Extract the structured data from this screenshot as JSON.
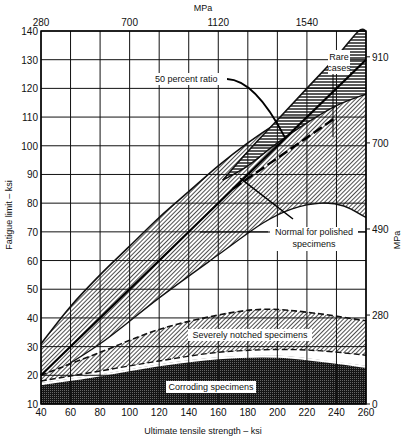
{
  "chart_data": {
    "type": "area",
    "title": "",
    "xlabel": "Ultimate tensile strength – ksi",
    "ylabel": "Fatigue limit – ksi",
    "top_axis_label": "MPa",
    "right_axis_label": "MPa",
    "xlim": [
      40,
      260
    ],
    "ylim": [
      10,
      140
    ],
    "x_ticks": [
      40,
      60,
      80,
      100,
      120,
      140,
      160,
      180,
      200,
      220,
      240,
      260
    ],
    "y_ticks": [
      10,
      20,
      30,
      40,
      50,
      60,
      70,
      80,
      90,
      100,
      110,
      120,
      130,
      140
    ],
    "top_ticks": [
      {
        "label": "280",
        "ksi": 40
      },
      {
        "label": "700",
        "ksi": 100
      },
      {
        "label": "1120",
        "ksi": 160
      },
      {
        "label": "1540",
        "ksi": 220
      }
    ],
    "right_ticks": [
      {
        "label": "0",
        "ksi": 10
      },
      {
        "label": "280",
        "ksi": 41
      },
      {
        "label": "490",
        "ksi": 71
      },
      {
        "label": "700",
        "ksi": 101
      },
      {
        "label": "910",
        "ksi": 131
      }
    ],
    "grid": true,
    "regions": [
      {
        "name": "Corroding specimens",
        "pattern": "dense-dots",
        "upper": [
          [
            40,
            17
          ],
          [
            80,
            20
          ],
          [
            120,
            23.5
          ],
          [
            160,
            26
          ],
          [
            200,
            26.5
          ],
          [
            230,
            25
          ],
          [
            260,
            23
          ]
        ],
        "lower": [
          [
            40,
            10
          ],
          [
            260,
            10
          ]
        ]
      },
      {
        "name": "Severely notched specimens",
        "pattern": "diagonal-hatch",
        "upper": [
          [
            40,
            20
          ],
          [
            80,
            28
          ],
          [
            120,
            36
          ],
          [
            160,
            41
          ],
          [
            190,
            43
          ],
          [
            220,
            42
          ],
          [
            260,
            39
          ]
        ],
        "lower": [
          [
            40,
            18
          ],
          [
            80,
            21.5
          ],
          [
            120,
            25
          ],
          [
            160,
            28
          ],
          [
            200,
            29
          ],
          [
            230,
            28.5
          ],
          [
            260,
            27
          ]
        ]
      },
      {
        "name": "Normal for polished specimens",
        "pattern": "diagonal-hatch",
        "upper": [
          [
            40,
            31
          ],
          [
            60,
            44
          ],
          [
            80,
            55
          ],
          [
            100,
            65
          ],
          [
            120,
            75
          ],
          [
            140,
            84
          ],
          [
            160,
            93
          ],
          [
            180,
            101
          ],
          [
            200,
            108
          ],
          [
            220,
            114
          ],
          [
            240,
            117
          ],
          [
            260,
            118
          ]
        ],
        "lower": [
          [
            40,
            18
          ],
          [
            80,
            31
          ],
          [
            120,
            47
          ],
          [
            160,
            62
          ],
          [
            190,
            73
          ],
          [
            210,
            78
          ],
          [
            230,
            80
          ],
          [
            245,
            79
          ],
          [
            260,
            75
          ]
        ]
      },
      {
        "name": "Rare cases",
        "pattern": "horizontal-hatch",
        "upper": [
          [
            163,
            88
          ],
          [
            180,
            98
          ],
          [
            200,
            109
          ],
          [
            220,
            120
          ],
          [
            240,
            131
          ],
          [
            255,
            140
          ],
          [
            260,
            140
          ]
        ],
        "lower": [
          [
            163,
            88
          ],
          [
            180,
            93
          ],
          [
            200,
            101
          ],
          [
            220,
            108
          ],
          [
            240,
            114
          ],
          [
            260,
            118
          ]
        ]
      }
    ],
    "series": [
      {
        "name": "50 percent ratio",
        "type": "line",
        "x": [
          40,
          260
        ],
        "y": [
          20,
          130
        ]
      },
      {
        "name": "Normal mean (dashed)",
        "type": "line",
        "x": [
          170,
          240
        ],
        "y": [
          85,
          110
        ]
      }
    ],
    "annotations": [
      {
        "text": "50 percent ratio",
        "points_to": [
          205,
          103
        ]
      },
      {
        "text": "Rare cases",
        "points_to": [
          225,
          100
        ]
      },
      {
        "text": "Normal for polished specimens",
        "points_to": [
          168,
          88
        ]
      },
      {
        "text": "Severely notched specimens"
      },
      {
        "text": "Corroding specimens"
      }
    ]
  }
}
